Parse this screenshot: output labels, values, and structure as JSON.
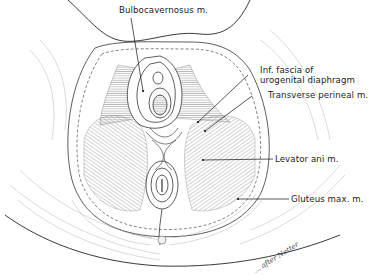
{
  "figure": {
    "labels": [
      {
        "id": "bulbocavernosus",
        "text": "Bulbocavernosus m."
      },
      {
        "id": "inf-fascia-line1",
        "text": "Inf. fascia of"
      },
      {
        "id": "inf-fascia-line2",
        "text": "urogenital diaphragm"
      },
      {
        "id": "transverse-perineal",
        "text": "Transverse perineal m."
      },
      {
        "id": "levator-ani",
        "text": "Levator ani m."
      },
      {
        "id": "gluteus-max",
        "text": "Gluteus max. m."
      }
    ],
    "signature": "… after Netter",
    "colors": {
      "ink": "#1a1a1a",
      "hatch": "#8a8a8a",
      "background": "#ffffff"
    }
  }
}
